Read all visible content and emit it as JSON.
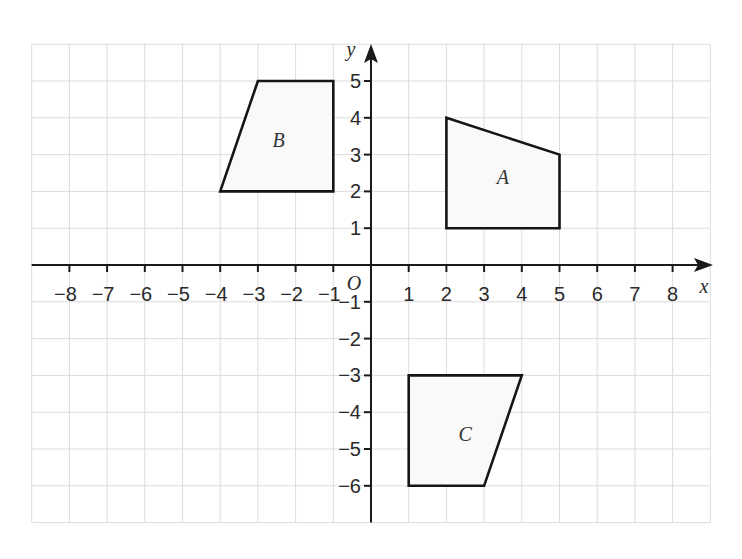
{
  "diagram": {
    "type": "coordinate-grid",
    "x_axis": {
      "label": "x",
      "min": -9,
      "max": 9,
      "tick_labels": [
        "-8",
        "-7",
        "-6",
        "-5",
        "-4",
        "-3",
        "-2",
        "-1",
        "1",
        "2",
        "3",
        "4",
        "5",
        "6",
        "7",
        "8"
      ]
    },
    "y_axis": {
      "label": "y",
      "min": -7,
      "max": 6,
      "tick_labels": [
        "5",
        "4",
        "3",
        "2",
        "1",
        "-1",
        "-2",
        "-3",
        "-4",
        "-5",
        "-6"
      ]
    },
    "origin_label": "O",
    "shapes": [
      {
        "name": "A",
        "vertices": [
          [
            2,
            4
          ],
          [
            5,
            3
          ],
          [
            5,
            1
          ],
          [
            2,
            1
          ]
        ],
        "label_pos": [
          3.5,
          2.4
        ]
      },
      {
        "name": "B",
        "vertices": [
          [
            -3,
            5
          ],
          [
            -1,
            5
          ],
          [
            -1,
            2
          ],
          [
            -4,
            2
          ]
        ],
        "label_pos": [
          -2.45,
          3.4
        ]
      },
      {
        "name": "C",
        "vertices": [
          [
            1,
            -3
          ],
          [
            4,
            -3
          ],
          [
            3,
            -6
          ],
          [
            1,
            -6
          ]
        ],
        "label_pos": [
          2.5,
          -4.6
        ]
      }
    ],
    "colors": {
      "grid": "#dcdcdc",
      "axis": "#1a1a1a",
      "shape_stroke": "#151515",
      "shape_fill": "#f9f9f9"
    }
  }
}
